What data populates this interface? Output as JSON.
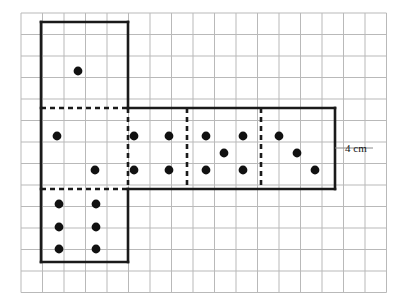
{
  "figure": {
    "type": "geometry-net-diagram",
    "grid": {
      "visible": true,
      "cell_size_px": 21.5,
      "columns": 17,
      "rows": 13,
      "origin_x": 21,
      "origin_y": 13,
      "line_color": "#b9b9b9",
      "line_width": 1
    },
    "outline_color": "#1a1a1a",
    "outline_width": 2.6,
    "fold_line_color": "#1a1a1a",
    "fold_line_style": "dashed",
    "pip_color": "#111111",
    "pip_radius_px": 4.4
  },
  "annotations": [
    {
      "id": "side-length-label",
      "text": "4 cm",
      "x": 345,
      "y": 152,
      "tick": {
        "x1": 335,
        "y1": 148,
        "x2": 373,
        "y2": 148
      }
    }
  ],
  "faces": [
    {
      "id": "face-top",
      "name": "top-square-face",
      "pips": 1,
      "rect": {
        "x": 41,
        "y": 22,
        "w": 87,
        "h": 86
      },
      "edges": {
        "top": "solid",
        "right": "solid",
        "bottom": "dashed",
        "left": "solid"
      }
    },
    {
      "id": "face-left-middle",
      "name": "left-middle-face",
      "pips": 2,
      "rect": {
        "x": 41,
        "y": 108,
        "w": 87,
        "h": 81
      },
      "edges": {
        "top": "dashed",
        "right": "dashed",
        "bottom": "dashed",
        "left": "solid"
      }
    },
    {
      "id": "face-second",
      "name": "second-face",
      "pips": 4,
      "rect": {
        "x": 128,
        "y": 108,
        "w": 59,
        "h": 81
      },
      "edges": {
        "top": "solid",
        "right": "dashed",
        "bottom": "solid",
        "left": "dashed"
      }
    },
    {
      "id": "face-third",
      "name": "third-face",
      "pips": 5,
      "rect": {
        "x": 187,
        "y": 108,
        "w": 74,
        "h": 81
      },
      "edges": {
        "top": "solid",
        "right": "dashed",
        "bottom": "solid",
        "left": "dashed"
      }
    },
    {
      "id": "face-fourth",
      "name": "fourth-face",
      "pips": 3,
      "rect": {
        "x": 261,
        "y": 108,
        "w": 74,
        "h": 81
      },
      "edges": {
        "top": "solid",
        "right": "solid",
        "bottom": "solid",
        "left": "dashed"
      }
    },
    {
      "id": "face-bottom",
      "name": "bottom-square-face",
      "pips": 6,
      "rect": {
        "x": 41,
        "y": 189,
        "w": 87,
        "h": 73
      },
      "edges": {
        "top": "dashed",
        "right": "solid",
        "bottom": "solid",
        "left": "solid"
      }
    }
  ],
  "pip_positions": [
    {
      "face": "face-top",
      "cx": 78,
      "cy": 71
    },
    {
      "face": "face-left-middle",
      "cx": 57,
      "cy": 136
    },
    {
      "face": "face-left-middle",
      "cx": 95,
      "cy": 170
    },
    {
      "face": "face-second",
      "cx": 134,
      "cy": 136
    },
    {
      "face": "face-second",
      "cx": 169,
      "cy": 136
    },
    {
      "face": "face-second",
      "cx": 134,
      "cy": 170
    },
    {
      "face": "face-second",
      "cx": 169,
      "cy": 170
    },
    {
      "face": "face-third",
      "cx": 206,
      "cy": 136
    },
    {
      "face": "face-third",
      "cx": 243,
      "cy": 136
    },
    {
      "face": "face-third",
      "cx": 224,
      "cy": 153
    },
    {
      "face": "face-third",
      "cx": 206,
      "cy": 170
    },
    {
      "face": "face-third",
      "cx": 243,
      "cy": 170
    },
    {
      "face": "face-fourth",
      "cx": 279,
      "cy": 136
    },
    {
      "face": "face-fourth",
      "cx": 297,
      "cy": 153
    },
    {
      "face": "face-fourth",
      "cx": 315,
      "cy": 170
    },
    {
      "face": "face-bottom",
      "cx": 59,
      "cy": 204
    },
    {
      "face": "face-bottom",
      "cx": 96,
      "cy": 204
    },
    {
      "face": "face-bottom",
      "cx": 59,
      "cy": 227
    },
    {
      "face": "face-bottom",
      "cx": 96,
      "cy": 227
    },
    {
      "face": "face-bottom",
      "cx": 59,
      "cy": 249
    },
    {
      "face": "face-bottom",
      "cx": 96,
      "cy": 249
    }
  ],
  "outline_path": "M 41 22 L 128 22 L 128 108 L 335 108 L 335 189 L 128 189 L 128 262 L 41 262 Z",
  "solid_segments": [
    {
      "name": "top-square-left",
      "x1": 41,
      "y1": 22,
      "x2": 41,
      "y2": 108
    },
    {
      "name": "top-square-top",
      "x1": 41,
      "y1": 22,
      "x2": 128,
      "y2": 22
    },
    {
      "name": "top-square-right",
      "x1": 128,
      "y1": 22,
      "x2": 128,
      "y2": 108
    },
    {
      "name": "strip-top",
      "x1": 128,
      "y1": 108,
      "x2": 335,
      "y2": 108
    },
    {
      "name": "strip-right",
      "x1": 335,
      "y1": 108,
      "x2": 335,
      "y2": 189
    },
    {
      "name": "strip-bottom",
      "x1": 128,
      "y1": 189,
      "x2": 335,
      "y2": 189
    },
    {
      "name": "middle-left",
      "x1": 41,
      "y1": 108,
      "x2": 41,
      "y2": 189
    },
    {
      "name": "bottom-square-left",
      "x1": 41,
      "y1": 189,
      "x2": 41,
      "y2": 262
    },
    {
      "name": "bottom-square-bottom",
      "x1": 41,
      "y1": 262,
      "x2": 128,
      "y2": 262
    },
    {
      "name": "bottom-square-right",
      "x1": 128,
      "y1": 189,
      "x2": 128,
      "y2": 262
    }
  ],
  "dashed_segments": [
    {
      "name": "fold-top-horizontal",
      "x1": 41,
      "y1": 108,
      "x2": 128,
      "y2": 108
    },
    {
      "name": "fold-bottom-horizontal",
      "x1": 41,
      "y1": 189,
      "x2": 128,
      "y2": 189
    },
    {
      "name": "fold-vertical-1",
      "x1": 128,
      "y1": 108,
      "x2": 128,
      "y2": 189
    },
    {
      "name": "fold-vertical-2",
      "x1": 187,
      "y1": 108,
      "x2": 187,
      "y2": 189
    },
    {
      "name": "fold-vertical-3",
      "x1": 261,
      "y1": 108,
      "x2": 261,
      "y2": 189
    }
  ]
}
